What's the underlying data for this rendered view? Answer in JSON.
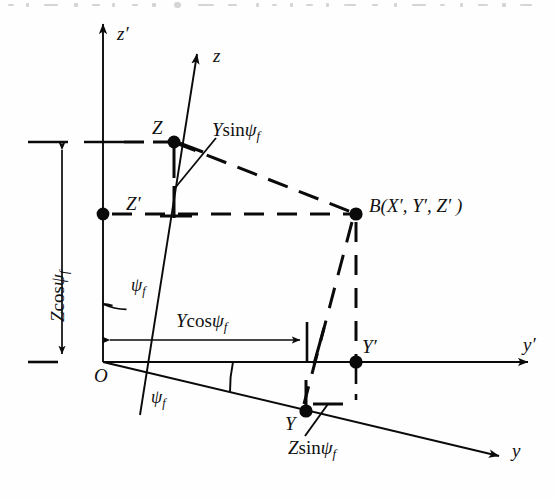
{
  "figure": {
    "type": "geometry-diagram",
    "background": "#ffffff",
    "ink": "#0a0a0a"
  },
  "axes": {
    "z_prime": {
      "label": "z",
      "prime": "′",
      "arrow_tip": [
        102,
        18
      ]
    },
    "z": {
      "label": "z",
      "prime": "",
      "arrow_tip": [
        200,
        48
      ]
    },
    "y_prime": {
      "label": "y",
      "prime": "′",
      "arrow_tip": [
        535,
        363
      ]
    },
    "y": {
      "label": "y",
      "prime": "",
      "arrow_tip": [
        506,
        461
      ]
    }
  },
  "points": {
    "origin": {
      "label": "O",
      "prime": ""
    },
    "Z": {
      "label": "Z",
      "prime": ""
    },
    "Z_prime": {
      "label": "Z",
      "prime": "′"
    },
    "Y": {
      "label": "Y",
      "prime": ""
    },
    "Y_prime": {
      "label": "Y",
      "prime": "′"
    },
    "B": {
      "label": "B(X′, Y′, Z′ )"
    }
  },
  "angles": {
    "upper": {
      "symbol": "ψ",
      "sub": "f"
    },
    "lower": {
      "symbol": "ψ",
      "sub": "f"
    }
  },
  "dimensions": {
    "z_cos": {
      "pre": "Z",
      "fn": "cos",
      "symbol": "ψ",
      "sub": "f",
      "orientation": "vertical"
    },
    "y_cos": {
      "pre": "Y",
      "fn": "cos",
      "symbol": "ψ",
      "sub": "f",
      "orientation": "horizontal"
    },
    "y_sin": {
      "pre": "Y",
      "fn": "sin",
      "symbol": "ψ",
      "sub": "f",
      "orientation": "leader"
    },
    "z_sin": {
      "pre": "Z",
      "fn": "sin",
      "symbol": "ψ",
      "sub": "f",
      "orientation": "leader"
    }
  }
}
